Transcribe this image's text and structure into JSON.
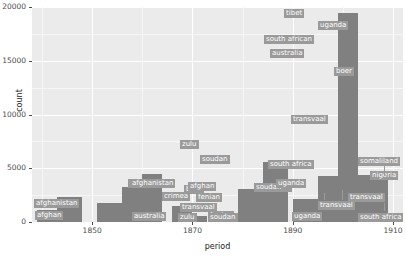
{
  "chart_data": {
    "type": "bar",
    "title": "",
    "subtitle": "",
    "xlabel": "period",
    "ylabel": "count",
    "xlim": [
      1838,
      1912
    ],
    "ylim": [
      0,
      20000
    ],
    "xticks": [
      1850,
      1870,
      1890,
      1910
    ],
    "xtick_labels": [
      "1850",
      "1870",
      "1890",
      "1910"
    ],
    "yticks": [
      0,
      5000,
      10000,
      15000,
      20000
    ],
    "ytick_labels": [
      "0",
      "5000",
      "10000",
      "15000",
      "20000"
    ],
    "grid": true,
    "legend": "none",
    "panel_bg": "#ebebeb",
    "bar_color": "#808080",
    "label_bg": "#9a9a9a",
    "label_color": "#ffffff",
    "bars": [
      {
        "label": "afghan",
        "x0": 1839,
        "x1": 1843,
        "value": 1100
      },
      {
        "label": "afghanistan",
        "x0": 1843,
        "x1": 1848,
        "value": 2350
      },
      {
        "label": "australia",
        "x0": 1851,
        "x1": 1856,
        "value": 1800
      },
      {
        "label": "crimea",
        "x0": 1856,
        "x1": 1860,
        "value": 3300
      },
      {
        "label": "the crimea",
        "x0": 1860,
        "x1": 1864,
        "value": 4500
      },
      {
        "label": "fenian",
        "x0": 1866,
        "x1": 1870,
        "value": 1450
      },
      {
        "label": "fenian",
        "x0": 1870,
        "x1": 1873,
        "value": 600
      },
      {
        "label": "zulu",
        "x0": 1874,
        "x1": 1878,
        "value": 700
      },
      {
        "label": "soudan",
        "x0": 1878,
        "x1": 1881,
        "value": 850
      },
      {
        "label": "boer",
        "x0": 1881,
        "x1": 1884,
        "value": 2600
      },
      {
        "label": "afghanistan",
        "x0": 1879,
        "x1": 1884,
        "value": 3050
      },
      {
        "label": "transvaal",
        "x0": 1884,
        "x1": 1889,
        "value": 1550
      },
      {
        "label": "afghan",
        "x0": 1884,
        "x1": 1889,
        "value": 2550
      },
      {
        "label": "soudan",
        "x0": 1884,
        "x1": 1889,
        "value": 4800
      },
      {
        "label": "zulu",
        "x0": 1884,
        "x1": 1889,
        "value": 5550
      },
      {
        "label": "uganda",
        "x0": 1890,
        "x1": 1894,
        "value": 900
      },
      {
        "label": "soudan ~",
        "x0": 1890,
        "x1": 1895,
        "value": 2100
      },
      {
        "label": "transvaal",
        "x0": 1895,
        "x1": 1898,
        "value": 1350
      },
      {
        "label": "uganda",
        "x0": 1895,
        "x1": 1898,
        "value": 3050
      },
      {
        "label": "south africa",
        "x0": 1895,
        "x1": 1899,
        "value": 4300
      },
      {
        "label": "transvaal",
        "x0": 1899,
        "x1": 1903,
        "value": 11500
      },
      {
        "label": "boer",
        "x0": 1899,
        "x1": 1903,
        "value": 15200
      },
      {
        "label": "australia",
        "x0": 1899,
        "x1": 1903,
        "value": 16500
      },
      {
        "label": "south african",
        "x0": 1899,
        "x1": 1903,
        "value": 17600
      },
      {
        "label": "uganda",
        "x0": 1899,
        "x1": 1903,
        "value": 18800
      },
      {
        "label": "tibet",
        "x0": 1899,
        "x1": 1903,
        "value": 19400
      },
      {
        "label": "south africa",
        "x0": 1903,
        "x1": 1909,
        "value": 1100
      },
      {
        "label": "transvaal",
        "x0": 1903,
        "x1": 1909,
        "value": 2450
      },
      {
        "label": "nigeria",
        "x0": 1903,
        "x1": 1909,
        "value": 3350
      },
      {
        "label": "somaliland",
        "x0": 1903,
        "x1": 1909,
        "value": 4350
      }
    ],
    "label_annotations": [
      "afghan",
      "afghanistan",
      "australia",
      "crimea",
      "the crimea",
      "fenian",
      "fenian",
      "zulu",
      "soudan",
      "boer",
      "afghanistan",
      "transvaal",
      "afghan",
      "soudan",
      "zulu",
      "uganda",
      "soudan ~",
      "transvaal",
      "uganda",
      "south africa",
      "transvaal",
      "boer",
      "australia",
      "south african",
      "uganda",
      "tibet",
      "south africa",
      "transvaal",
      "nigeria",
      "somaliland"
    ]
  }
}
